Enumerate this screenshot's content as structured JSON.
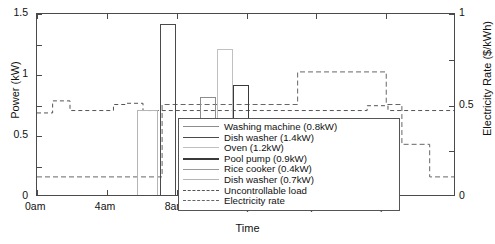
{
  "chart_data": {
    "type": "bar",
    "title": "",
    "xlabel": "Time",
    "ylabel": "Power (kW)",
    "y2label": "Electricity Rate ($/kWh)",
    "xlim": [
      0,
      24
    ],
    "ylim": [
      0,
      1.5
    ],
    "y2lim": [
      0,
      1
    ],
    "grid": false,
    "legend_position": "lower-center-right",
    "xticks": [
      {
        "value": 0,
        "label": "0am"
      },
      {
        "value": 4,
        "label": "4am"
      },
      {
        "value": 8,
        "label": "8am"
      },
      {
        "value": 12,
        "label": "12pm"
      },
      {
        "value": 16,
        "label": "4pm"
      },
      {
        "value": 20,
        "label": "8pm"
      }
    ],
    "yticks_left": [
      {
        "value": 0,
        "label": "0"
      },
      {
        "value": 0.5,
        "label": "0.5"
      },
      {
        "value": 1,
        "label": "1"
      },
      {
        "value": 1.5,
        "label": "1.5"
      }
    ],
    "yticks_right": [
      {
        "value": 0,
        "label": "0"
      },
      {
        "value": 0.5,
        "label": "0.5"
      },
      {
        "value": 1,
        "label": "1"
      }
    ],
    "bars": [
      {
        "name": "Washing machine (0.8kW)",
        "start": 9.35,
        "end": 10.25,
        "value": 0.8,
        "color": "#8c8c8c",
        "lw": 1.0
      },
      {
        "name": "Dish washer (1.4kW)",
        "start": 7.05,
        "end": 7.95,
        "value": 1.4,
        "color": "#4a4a4a",
        "lw": 1.4
      },
      {
        "name": "Oven (1.2kW)",
        "start": 10.3,
        "end": 11.2,
        "value": 1.2,
        "color": "#c0c0c0",
        "lw": 1.0
      },
      {
        "name": "Pool pump (0.9kW)",
        "start": 11.25,
        "end": 12.15,
        "value": 0.9,
        "color": "#3a3a3a",
        "lw": 1.6
      },
      {
        "name": "Rice cooker (0.4kW)",
        "start": 8.1,
        "end": 9.3,
        "value": 0.4,
        "color": "#9a9a9a",
        "lw": 1.0
      },
      {
        "name": "Dish washer (0.7kW)",
        "start": 5.75,
        "end": 6.95,
        "value": 0.7,
        "color": "#b5b5b5",
        "lw": 1.0
      }
    ],
    "uncontrollable_load": {
      "name": "Uncontrollable load",
      "color": "#555555",
      "style": "dashed",
      "points": [
        {
          "t": 0,
          "v": 0.68
        },
        {
          "t": 0.9,
          "v": 0.68
        },
        {
          "t": 0.9,
          "v": 0.78
        },
        {
          "t": 1.9,
          "v": 0.78
        },
        {
          "t": 1.9,
          "v": 0.7
        },
        {
          "t": 4.4,
          "v": 0.7
        },
        {
          "t": 4.4,
          "v": 0.75
        },
        {
          "t": 5.1,
          "v": 0.75
        },
        {
          "t": 5.1,
          "v": 0.76
        },
        {
          "t": 6.1,
          "v": 0.76
        },
        {
          "t": 6.1,
          "v": 0.7
        },
        {
          "t": 19.0,
          "v": 0.7
        },
        {
          "t": 19.0,
          "v": 0.74
        },
        {
          "t": 20.2,
          "v": 0.74
        },
        {
          "t": 20.2,
          "v": 0.7
        },
        {
          "t": 24,
          "v": 0.7
        }
      ]
    },
    "electricity_rate": {
      "name": "Electricity rate",
      "color": "#666666",
      "style": "dashed",
      "axis": "right",
      "points": [
        {
          "t": 0,
          "v": 0.1
        },
        {
          "t": 7.2,
          "v": 0.1
        },
        {
          "t": 7.2,
          "v": 0.5
        },
        {
          "t": 15.0,
          "v": 0.5
        },
        {
          "t": 15.0,
          "v": 0.68
        },
        {
          "t": 20.1,
          "v": 0.68
        },
        {
          "t": 20.1,
          "v": 0.5
        },
        {
          "t": 21.0,
          "v": 0.5
        },
        {
          "t": 21.0,
          "v": 0.28
        },
        {
          "t": 22.6,
          "v": 0.28
        },
        {
          "t": 22.6,
          "v": 0.1
        },
        {
          "t": 24,
          "v": 0.1
        }
      ]
    },
    "legend": [
      {
        "label": "Washing machine (0.8kW)",
        "color": "#8c8c8c",
        "style": "solid",
        "lw": 1.2
      },
      {
        "label": "Dish washer (1.4kW)",
        "color": "#4a4a4a",
        "style": "solid",
        "lw": 1.8
      },
      {
        "label": "Oven (1.2kW)",
        "color": "#c0c0c0",
        "style": "solid",
        "lw": 1.2
      },
      {
        "label": "Pool pump (0.9kW)",
        "color": "#3a3a3a",
        "style": "solid",
        "lw": 2.0
      },
      {
        "label": "Rice cooker (0.4kW)",
        "color": "#9a9a9a",
        "style": "solid",
        "lw": 1.2
      },
      {
        "label": "Dish washer (0.7kW)",
        "color": "#b5b5b5",
        "style": "solid",
        "lw": 1.2
      },
      {
        "label": "Uncontrollable load",
        "color": "#555555",
        "style": "dashed",
        "lw": 1.1
      },
      {
        "label": "Electricity rate",
        "color": "#666666",
        "style": "dashed",
        "lw": 1.1
      }
    ]
  }
}
